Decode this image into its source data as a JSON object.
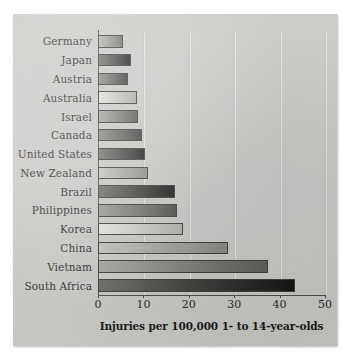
{
  "chart_data": {
    "type": "bar",
    "orientation": "horizontal",
    "title": "",
    "xlabel": "Injuries per 100,000 1- to 14-year-olds",
    "ylabel": "",
    "xlim": [
      0,
      50
    ],
    "xticks": [
      "0",
      "10",
      "20",
      "30",
      "40",
      "50"
    ],
    "grid": "vertical",
    "legend": "none",
    "categories": [
      "Germany",
      "Japan",
      "Austria",
      "Australia",
      "Israel",
      "Canada",
      "United States",
      "New Zealand",
      "Brazil",
      "Philippines",
      "Korea",
      "China",
      "Vietnam",
      "South Africa"
    ],
    "values": [
      5.6,
      7.2,
      6.6,
      8.5,
      8.9,
      9.6,
      10.3,
      11.0,
      17.0,
      17.4,
      18.8,
      28.6,
      37.5,
      43.5
    ],
    "bar_shades": [
      {
        "from": "#b6b6b2",
        "to": "#6f6f6b"
      },
      {
        "from": "#777773",
        "to": "#1e1e1c"
      },
      {
        "from": "#8f8f8b",
        "to": "#3a3a37"
      },
      {
        "from": "#e0e0dc",
        "to": "#a9a9a4"
      },
      {
        "from": "#a8a8a3",
        "to": "#585854"
      },
      {
        "from": "#8a8a86",
        "to": "#3f3f3c"
      },
      {
        "from": "#767672",
        "to": "#1d1d1b"
      },
      {
        "from": "#c6c6c1",
        "to": "#8d8d88"
      },
      {
        "from": "#6e6e6a",
        "to": "#151513"
      },
      {
        "from": "#9d9d98",
        "to": "#4c4c49"
      },
      {
        "from": "#e5e5e1",
        "to": "#b1b1ac"
      },
      {
        "from": "#c2c2bd",
        "to": "#868681"
      },
      {
        "from": "#a6a6a1",
        "to": "#5b5b57"
      },
      {
        "from": "#6a6a66",
        "to": "#111110"
      }
    ]
  },
  "colors": {
    "panel_background": "#c9c9c6",
    "page_background": "#ffffff",
    "axis": "#4b4b49",
    "text": "#2e2e2c",
    "gridline": "#78787633"
  }
}
